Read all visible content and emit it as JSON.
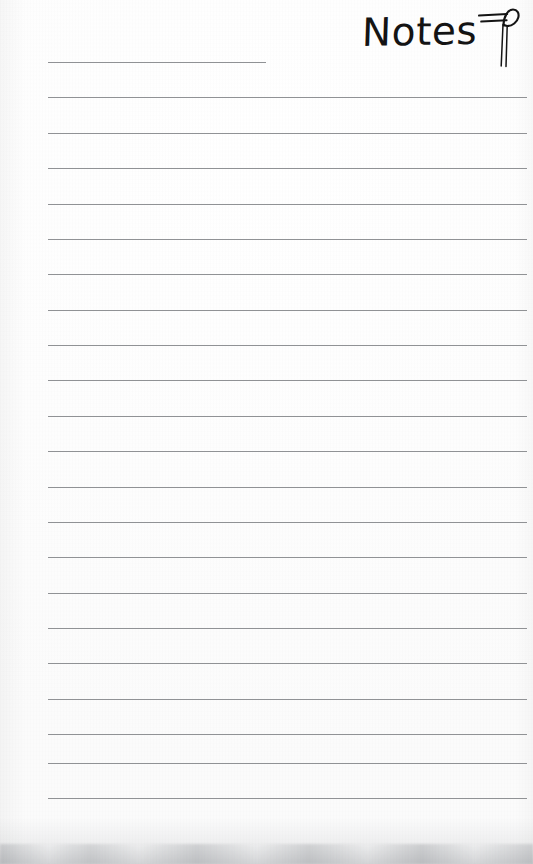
{
  "document": {
    "kind": "lined-notepaper",
    "title": "Notes",
    "body_text": "",
    "page_width": 533,
    "page_height": 864,
    "paper_color": "#fdfdfd",
    "rule_color": "#8a8c8f",
    "ink_color": "#141414"
  },
  "header": {
    "title": "Notes",
    "title_style": "handwritten",
    "icon": {
      "name": "quill-pen-icon",
      "label": "quill pen",
      "color": "#141414"
    }
  },
  "rules": {
    "count": 22,
    "first_y": 62,
    "spacing": 35.4,
    "left": 48,
    "right": 527,
    "short_first_line": true,
    "short_first_line_right": 266,
    "lines": [
      {
        "index": 1,
        "y": 62,
        "width": "short",
        "content": ""
      },
      {
        "index": 2,
        "y": 97,
        "width": "full",
        "content": ""
      },
      {
        "index": 3,
        "y": 133,
        "width": "full",
        "content": ""
      },
      {
        "index": 4,
        "y": 168,
        "width": "full",
        "content": ""
      },
      {
        "index": 5,
        "y": 204,
        "width": "full",
        "content": ""
      },
      {
        "index": 6,
        "y": 239,
        "width": "full",
        "content": ""
      },
      {
        "index": 7,
        "y": 274,
        "width": "full",
        "content": ""
      },
      {
        "index": 8,
        "y": 310,
        "width": "full",
        "content": ""
      },
      {
        "index": 9,
        "y": 345,
        "width": "full",
        "content": ""
      },
      {
        "index": 10,
        "y": 380,
        "width": "full",
        "content": ""
      },
      {
        "index": 11,
        "y": 416,
        "width": "full",
        "content": ""
      },
      {
        "index": 12,
        "y": 451,
        "width": "full",
        "content": ""
      },
      {
        "index": 13,
        "y": 487,
        "width": "full",
        "content": ""
      },
      {
        "index": 14,
        "y": 522,
        "width": "full",
        "content": ""
      },
      {
        "index": 15,
        "y": 557,
        "width": "full",
        "content": ""
      },
      {
        "index": 16,
        "y": 593,
        "width": "full",
        "content": ""
      },
      {
        "index": 17,
        "y": 628,
        "width": "full",
        "content": ""
      },
      {
        "index": 18,
        "y": 663,
        "width": "full",
        "content": ""
      },
      {
        "index": 19,
        "y": 699,
        "width": "full",
        "content": ""
      },
      {
        "index": 20,
        "y": 734,
        "width": "full",
        "content": ""
      },
      {
        "index": 21,
        "y": 763,
        "width": "full",
        "content": ""
      },
      {
        "index": 22,
        "y": 798,
        "width": "full",
        "content": ""
      }
    ]
  }
}
